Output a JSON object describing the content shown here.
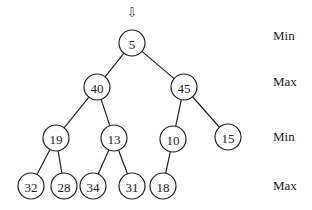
{
  "diagram": {
    "pointer": {
      "icon": "down-arrow-icon",
      "glyph": "⇩",
      "x": 132,
      "y": 13
    },
    "nodes": [
      {
        "id": "n0",
        "value": "5",
        "x": 132,
        "y": 43
      },
      {
        "id": "n1",
        "value": "40",
        "x": 97,
        "y": 87
      },
      {
        "id": "n2",
        "value": "45",
        "x": 184,
        "y": 87
      },
      {
        "id": "n3",
        "value": "19",
        "x": 56,
        "y": 138
      },
      {
        "id": "n4",
        "value": "13",
        "x": 114,
        "y": 138
      },
      {
        "id": "n5",
        "value": "10",
        "x": 173,
        "y": 139
      },
      {
        "id": "n6",
        "value": "15",
        "x": 228,
        "y": 137
      },
      {
        "id": "n7",
        "value": "32",
        "x": 31,
        "y": 186
      },
      {
        "id": "n8",
        "value": "28",
        "x": 64,
        "y": 186
      },
      {
        "id": "n9",
        "value": "34",
        "x": 93,
        "y": 186
      },
      {
        "id": "n10",
        "value": "31",
        "x": 132,
        "y": 186
      },
      {
        "id": "n11",
        "value": "18",
        "x": 163,
        "y": 186
      }
    ],
    "edges": [
      [
        "n0",
        "n1"
      ],
      [
        "n0",
        "n2"
      ],
      [
        "n1",
        "n3"
      ],
      [
        "n1",
        "n4"
      ],
      [
        "n2",
        "n5"
      ],
      [
        "n2",
        "n6"
      ],
      [
        "n3",
        "n7"
      ],
      [
        "n3",
        "n8"
      ],
      [
        "n4",
        "n9"
      ],
      [
        "n4",
        "n10"
      ],
      [
        "n5",
        "n11"
      ]
    ],
    "levels": [
      {
        "label": "Min",
        "y": 36
      },
      {
        "label": "Max",
        "y": 82
      },
      {
        "label": "Min",
        "y": 137
      },
      {
        "label": "Max",
        "y": 186
      }
    ],
    "node_radius": 13,
    "label_x": 273
  }
}
